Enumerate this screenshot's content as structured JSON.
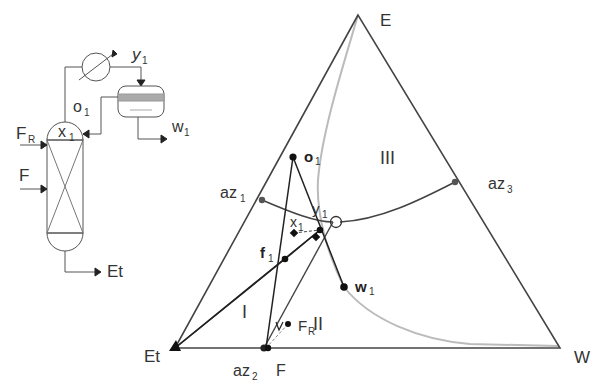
{
  "flowsheet": {
    "labels": {
      "FR_main": "F",
      "FR_sub": "R",
      "F": "F",
      "x1_main": "x",
      "x1_sub": "1",
      "o1_main": "o",
      "o1_sub": "1",
      "y1_main": "y",
      "y1_sub": "1",
      "w1_main": "w",
      "w1_sub": "1",
      "Et": "Et"
    }
  },
  "ternary": {
    "vertices": {
      "top": "E",
      "left": "Et",
      "right": "W"
    },
    "azeotropes": {
      "az1_main": "az",
      "az1_sub": "1",
      "az2_main": "az",
      "az2_sub": "2",
      "az3_main": "az",
      "az3_sub": "3"
    },
    "regions": {
      "r1": "I",
      "r2": "II",
      "r3": "III"
    },
    "points": {
      "o1_main": "o",
      "o1_sub": "1",
      "y1_main": "y",
      "y1_sub": "1",
      "x1_main": "x",
      "x1_sub": "1",
      "f1_main": "f",
      "f1_sub": "1",
      "w1_main": "w",
      "w1_sub": "1",
      "FR_main": "F",
      "FR_sub": "R",
      "F": "F"
    },
    "colors": {
      "line": "#222222",
      "boundary": "#444444",
      "binodal": "#bbbbbb",
      "point": "#111111"
    }
  }
}
